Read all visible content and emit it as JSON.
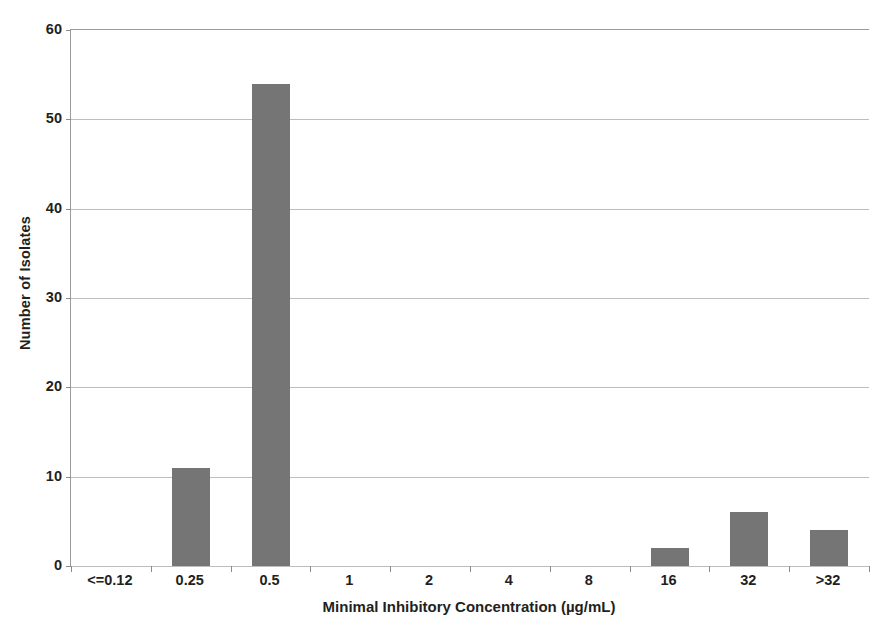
{
  "chart_data": {
    "type": "bar",
    "title": "",
    "subtitle": "",
    "xlabel": "Minimal Inhibitory Concentration (µg/mL)",
    "ylabel": "Number of Isolates",
    "categories": [
      "<=0.12",
      "0.25",
      "0.5",
      "1",
      "2",
      "4",
      "8",
      "16",
      "32",
      ">32"
    ],
    "values": [
      0,
      11,
      54,
      0,
      0,
      0,
      0,
      2,
      6,
      4
    ],
    "ylim": [
      0,
      60
    ],
    "ytick_labels": [
      "0",
      "10",
      "20",
      "30",
      "40",
      "50",
      "60"
    ],
    "ytick_values": [
      0,
      10,
      20,
      30,
      40,
      50,
      60
    ],
    "grid": "horizontal",
    "legend": "none",
    "bar_color": "#757575",
    "gridline_color": "#bdbdbd",
    "axis_color": "#8d8d8d",
    "text_color": "#231f20",
    "background": "#ffffff"
  }
}
